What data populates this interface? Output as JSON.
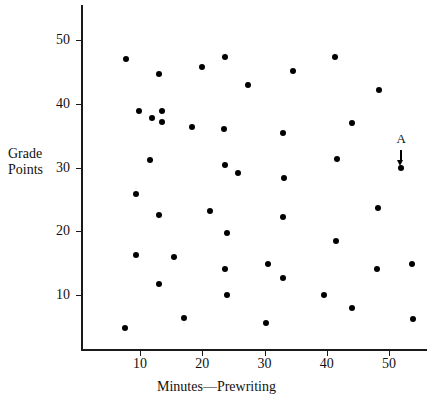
{
  "chart_data": {
    "type": "scatter",
    "title": "",
    "xlabel": "Minutes—Prewriting",
    "ylabel": "Grade Points",
    "ylabel_line1": "Grade",
    "ylabel_line2": "Points",
    "xlim": [
      0,
      55.5
    ],
    "ylim": [
      0,
      53
    ],
    "grid": false,
    "legend": null,
    "xticks": [
      10,
      20,
      30,
      40,
      50
    ],
    "yticks": [
      10,
      20,
      30,
      40,
      50
    ],
    "xticklabels": [
      "10",
      "20",
      "30",
      "40",
      "50"
    ],
    "yticklabels": [
      "10",
      "20",
      "30",
      "40",
      "50"
    ],
    "marker": "filled-circle",
    "marker_color": "#000000",
    "points": [
      {
        "x": 7.8,
        "y": 47.0
      },
      {
        "x": 13.0,
        "y": 44.7
      },
      {
        "x": 20.0,
        "y": 45.7
      },
      {
        "x": 23.6,
        "y": 47.4
      },
      {
        "x": 27.3,
        "y": 43.0
      },
      {
        "x": 34.5,
        "y": 45.2
      },
      {
        "x": 41.4,
        "y": 47.4
      },
      {
        "x": 48.4,
        "y": 42.2
      },
      {
        "x": 9.8,
        "y": 38.9
      },
      {
        "x": 11.9,
        "y": 37.8
      },
      {
        "x": 13.6,
        "y": 38.9
      },
      {
        "x": 13.5,
        "y": 37.1
      },
      {
        "x": 18.3,
        "y": 36.4
      },
      {
        "x": 23.5,
        "y": 36.0
      },
      {
        "x": 33.0,
        "y": 35.4
      },
      {
        "x": 44.0,
        "y": 37.0
      },
      {
        "x": 11.6,
        "y": 31.2
      },
      {
        "x": 23.6,
        "y": 30.4
      },
      {
        "x": 25.8,
        "y": 29.2
      },
      {
        "x": 33.1,
        "y": 28.3
      },
      {
        "x": 41.6,
        "y": 31.4
      },
      {
        "x": 51.9,
        "y": 30.0
      },
      {
        "x": 9.3,
        "y": 25.9
      },
      {
        "x": 13.1,
        "y": 22.5
      },
      {
        "x": 21.2,
        "y": 23.1
      },
      {
        "x": 32.9,
        "y": 22.3
      },
      {
        "x": 48.3,
        "y": 23.6
      },
      {
        "x": 24.0,
        "y": 19.8
      },
      {
        "x": 41.5,
        "y": 18.4
      },
      {
        "x": 9.4,
        "y": 16.2
      },
      {
        "x": 15.4,
        "y": 15.9
      },
      {
        "x": 23.7,
        "y": 14.1
      },
      {
        "x": 30.5,
        "y": 14.8
      },
      {
        "x": 33.0,
        "y": 12.6
      },
      {
        "x": 48.1,
        "y": 14.1
      },
      {
        "x": 53.7,
        "y": 14.8
      },
      {
        "x": 13.1,
        "y": 11.7
      },
      {
        "x": 23.9,
        "y": 10.0
      },
      {
        "x": 39.5,
        "y": 10.0
      },
      {
        "x": 44.0,
        "y": 7.9
      },
      {
        "x": 17.0,
        "y": 6.4
      },
      {
        "x": 30.3,
        "y": 5.6
      },
      {
        "x": 53.8,
        "y": 6.3
      },
      {
        "x": 7.6,
        "y": 4.8
      }
    ],
    "annotations": [
      {
        "label": "A",
        "points_to_x": 51.9,
        "points_to_y": 30.0,
        "arrow": "down"
      }
    ]
  }
}
